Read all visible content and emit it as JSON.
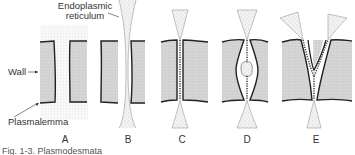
{
  "labels": {
    "er_line1": "Endoplasmic",
    "er_line2": "reticulum",
    "wall": "Wall",
    "plasmalemma": "Plasmalemma"
  },
  "panels": [
    {
      "id": "A",
      "label": "A"
    },
    {
      "id": "B",
      "label": "B"
    },
    {
      "id": "C",
      "label": "C"
    },
    {
      "id": "D",
      "label": "D"
    },
    {
      "id": "E",
      "label": "E"
    }
  ],
  "caption": "Fig. 1-3. Plasmodesmata"
}
